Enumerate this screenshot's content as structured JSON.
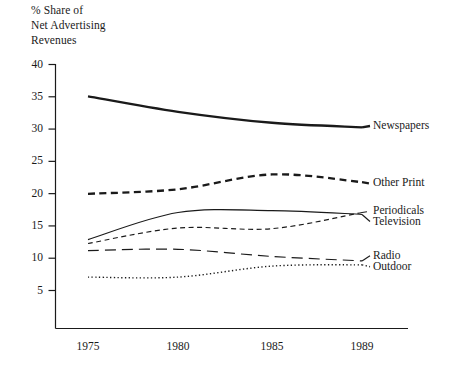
{
  "chart_data": {
    "type": "line",
    "title_lines": [
      "% Share of",
      "Net Advertising",
      "Revenues"
    ],
    "xlabel": "",
    "ylabel": "% Share of Net Advertising Revenues",
    "x": [
      1975,
      1980,
      1985,
      1989
    ],
    "categories": [
      "1975",
      "1980",
      "1985",
      "1989"
    ],
    "xtick_labels": [
      "1975",
      "1980",
      "1985",
      "1989"
    ],
    "ytick_labels": [
      "40",
      "35",
      "30",
      "25",
      "20",
      "15",
      "10",
      "5"
    ],
    "ytick_values": [
      40,
      35,
      30,
      25,
      20,
      15,
      10,
      5
    ],
    "ylim": [
      3.5,
      41
    ],
    "xlim": [
      1974.2,
      1990.2
    ],
    "grid": false,
    "legend_position": "right-inline",
    "series": [
      {
        "name": "Newspapers",
        "style": "solid-thick",
        "values": [
          35.0,
          32.6,
          30.9,
          30.2
        ],
        "label_value": 30.4
      },
      {
        "name": "Other Print",
        "style": "dashed-thick",
        "values": [
          19.9,
          20.6,
          22.9,
          21.7
        ],
        "label_value": 21.5
      },
      {
        "name": "Periodicals",
        "style": "dashed-thin",
        "values": [
          12.2,
          14.6,
          14.5,
          17.0
        ],
        "label_value": 17.2
      },
      {
        "name": "Television",
        "style": "solid-thin",
        "values": [
          12.8,
          17.0,
          17.3,
          16.7
        ],
        "label_value": 15.6
      },
      {
        "name": "Radio",
        "style": "long-dash",
        "values": [
          11.1,
          11.3,
          10.2,
          9.5
        ],
        "label_value": 10.3
      },
      {
        "name": "Outdoor",
        "style": "dotted",
        "values": [
          7.0,
          7.0,
          8.7,
          8.9
        ],
        "label_value": 8.6
      }
    ],
    "colors": {
      "line": "#1a1a1a",
      "axis": "#1a1a1a",
      "background": "#ffffff",
      "text": "#1a1a1a"
    }
  }
}
